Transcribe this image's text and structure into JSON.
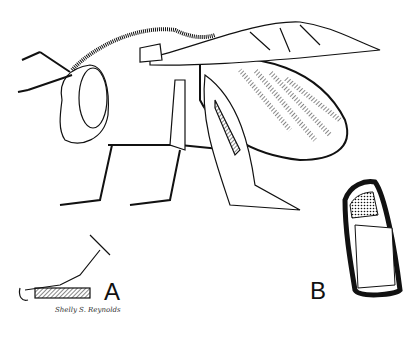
{
  "figure": {
    "labels": {
      "a": "A",
      "b": "B"
    },
    "signature": "Shelly S. Reynolds",
    "colors": {
      "ink": "#111111",
      "paper": "#ffffff"
    }
  }
}
